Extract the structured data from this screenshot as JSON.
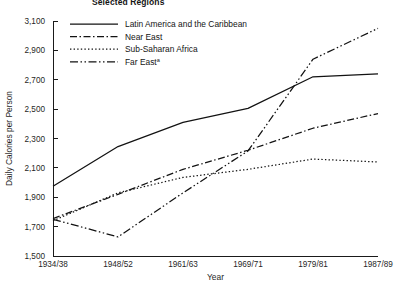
{
  "chart_data": {
    "type": "line",
    "title": "Selected Regions",
    "subtitle": "",
    "xlabel": "Year",
    "ylabel": "Daily Calories per Person",
    "categories": [
      "1934/38",
      "1948/52",
      "1961/63",
      "1969/71",
      "1979/81",
      "1987/89"
    ],
    "ylim": [
      1500,
      3100
    ],
    "yticks": [
      "1,500",
      "1,700",
      "1,900",
      "2,100",
      "2,300",
      "2,500",
      "2,700",
      "2,900",
      "3,100"
    ],
    "ytick_values": [
      1500,
      1700,
      1900,
      2100,
      2300,
      2500,
      2700,
      2900,
      3100
    ],
    "grid": false,
    "legend_position": "top-left-inside",
    "series": [
      {
        "name": "Latin America and the Caribbean",
        "style": "solid",
        "values": [
          1975,
          2245,
          2410,
          2505,
          2720,
          2740
        ]
      },
      {
        "name": "Near East",
        "style": "dash-dot",
        "values": [
          1755,
          1920,
          2090,
          2220,
          2370,
          2470
        ]
      },
      {
        "name": "Sub-Saharan Africa",
        "style": "dotted",
        "values": [
          1740,
          1930,
          2035,
          2090,
          2160,
          2140
        ]
      },
      {
        "name": "Far East",
        "style": "dash-dot-dot",
        "name_superscript": "a",
        "values": [
          1750,
          1630,
          1930,
          2215,
          2840,
          3050
        ]
      }
    ]
  },
  "legend": {
    "entries": [
      {
        "label": "Latin America and the Caribbean",
        "sup": ""
      },
      {
        "label": "Near East",
        "sup": ""
      },
      {
        "label": "Sub-Saharan Africa",
        "sup": ""
      },
      {
        "label": "Far East",
        "sup": "a"
      }
    ]
  }
}
